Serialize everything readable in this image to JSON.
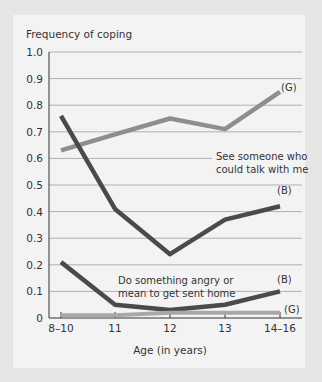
{
  "chart_data": {
    "type": "line",
    "title": "",
    "ylabel": "Frequency of coping",
    "xlabel": "Age (in years)",
    "categories": [
      "8–10",
      "11",
      "12",
      "13",
      "14–16"
    ],
    "y_ticks": [
      "0",
      "0.1",
      "0.2",
      "0.3",
      "0.4",
      "0.5",
      "0.6",
      "0.7",
      "0.8",
      "0.9",
      "1.0"
    ],
    "ylim": [
      0,
      1.0
    ],
    "grid": true,
    "series": [
      {
        "name": "See someone who could talk with me (G)",
        "group": "G",
        "color": "#8e8e8e",
        "values": [
          0.63,
          0.69,
          0.75,
          0.71,
          0.85
        ]
      },
      {
        "name": "See someone who could talk with me (B)",
        "group": "B",
        "color": "#4a4a4a",
        "values": [
          0.76,
          0.41,
          0.24,
          0.37,
          0.42
        ]
      },
      {
        "name": "Do something angry or mean to get sent home (B)",
        "group": "B",
        "color": "#4a4a4a",
        "values": [
          0.21,
          0.05,
          0.03,
          0.05,
          0.1
        ]
      },
      {
        "name": "Do something angry or mean to get sent home (G)",
        "group": "G",
        "color": "#a8a8a8",
        "values": [
          0.01,
          0.01,
          0.02,
          0.02,
          0.02
        ]
      }
    ],
    "annotations": [
      {
        "text": "See someone who",
        "line": 1
      },
      {
        "text": "could talk with me",
        "line": 2
      },
      {
        "text": "Do something angry or",
        "line": 1
      },
      {
        "text": "mean to get sent home",
        "line": 2
      },
      {
        "text": "(G)"
      },
      {
        "text": "(B)"
      },
      {
        "text": "(B)"
      },
      {
        "text": "(G)"
      }
    ]
  },
  "labels": {
    "ylabel": "Frequency of coping",
    "xlabel": "Age (in years)",
    "ann1_l1": "See someone who",
    "ann1_l2": "could talk with me",
    "ann2_l1": "Do something angry or",
    "ann2_l2": "mean to get sent home",
    "g_top": "(G)",
    "b_top": "(B)",
    "b_bottom": "(B)",
    "g_bottom": "(G)"
  }
}
